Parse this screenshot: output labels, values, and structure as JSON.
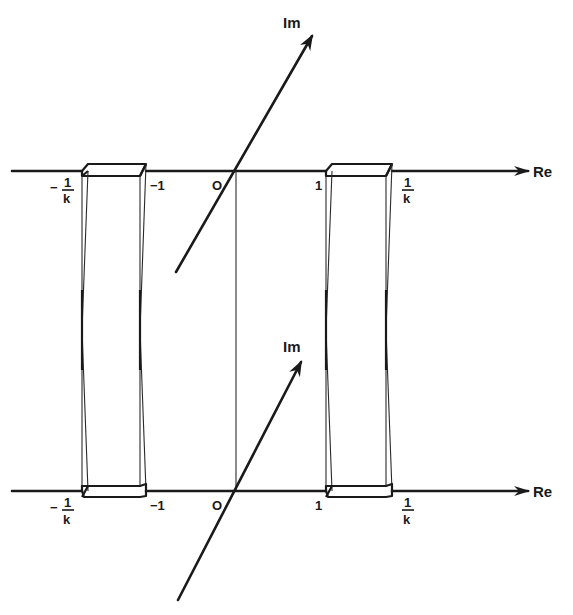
{
  "diagram": {
    "upper_sheet": {
      "real_axis_label": "Re",
      "imag_axis_label": "Im",
      "tick_labels": {
        "neg_inv_k_num": "1",
        "neg_inv_k_den": "k",
        "neg_inv_k_sign": "−",
        "neg_one": "−1",
        "origin": "O",
        "one": "1",
        "inv_k_num": "1",
        "inv_k_den": "k"
      }
    },
    "lower_sheet": {
      "real_axis_label": "Re",
      "imag_axis_label": "Im",
      "tick_labels": {
        "neg_inv_k_num": "1",
        "neg_inv_k_den": "k",
        "neg_inv_k_sign": "−",
        "neg_one": "−1",
        "origin": "O",
        "one": "1",
        "inv_k_num": "1",
        "inv_k_den": "k"
      }
    },
    "tubes": [
      {
        "name": "left-cut-tube",
        "from": "-1/k",
        "to": "-1"
      },
      {
        "name": "right-cut-tube",
        "from": "1",
        "to": "1/k"
      }
    ],
    "colors": {
      "ink": "#1a1a1a",
      "background": "#ffffff"
    }
  }
}
